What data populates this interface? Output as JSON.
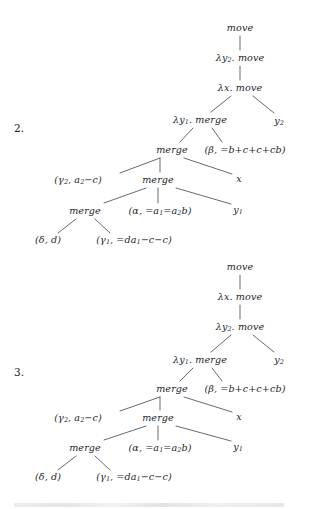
{
  "figure": {
    "background_color": "#ffffff",
    "text_color": "#22262b",
    "edge_color": "#4a4f55"
  },
  "trees": [
    {
      "number_label": "2.",
      "nodes": [
        {
          "id": "t2-move-root",
          "text": "move",
          "x": 240,
          "y": 28
        },
        {
          "id": "t2-lam-y2",
          "text": "λy₂. move",
          "x": 240,
          "y": 58
        },
        {
          "id": "t2-lam-x",
          "text": "λx. move",
          "x": 240,
          "y": 88
        },
        {
          "id": "t2-lam-y1",
          "text": "λy₁. merge",
          "x": 200,
          "y": 120
        },
        {
          "id": "t2-y2",
          "text": "y₂",
          "x": 279,
          "y": 121
        },
        {
          "id": "t2-merge-1",
          "text": "merge",
          "x": 172,
          "y": 150
        },
        {
          "id": "t2-beta",
          "text": "(β, =b+c+c+cb)",
          "x": 245,
          "y": 150
        },
        {
          "id": "t2-gamma2",
          "text": "(γ₂, a₂−c)",
          "x": 78,
          "y": 180
        },
        {
          "id": "t2-merge-2",
          "text": "merge",
          "x": 158,
          "y": 180
        },
        {
          "id": "t2-x",
          "text": "x",
          "x": 239,
          "y": 179
        },
        {
          "id": "t2-merge-3",
          "text": "merge",
          "x": 85,
          "y": 211
        },
        {
          "id": "t2-alpha",
          "text": "(α, =a₁=a₂b)",
          "x": 160,
          "y": 211
        },
        {
          "id": "t2-y1",
          "text": "y₁",
          "x": 238,
          "y": 210
        },
        {
          "id": "t2-delta",
          "text": "(δ, d)",
          "x": 48,
          "y": 240
        },
        {
          "id": "t2-gamma1",
          "text": "(γ₁, =da₁−c−c)",
          "x": 134,
          "y": 240
        }
      ],
      "edges": [
        {
          "from": "t2-move-root",
          "to": "t2-lam-y2",
          "x1": 240,
          "y1": 36,
          "x2": 240,
          "y2": 50
        },
        {
          "from": "t2-lam-y2",
          "to": "t2-lam-x",
          "x1": 240,
          "y1": 66,
          "x2": 240,
          "y2": 80
        },
        {
          "from": "t2-lam-x",
          "to": "t2-lam-y1",
          "x1": 231,
          "y1": 96,
          "x2": 211,
          "y2": 112
        },
        {
          "from": "t2-lam-x",
          "to": "t2-y2",
          "x1": 253,
          "y1": 96,
          "x2": 274,
          "y2": 113
        },
        {
          "from": "t2-lam-y1",
          "to": "t2-merge-1",
          "x1": 193,
          "y1": 128,
          "x2": 180,
          "y2": 142
        },
        {
          "from": "t2-lam-y1",
          "to": "t2-beta",
          "x1": 212,
          "y1": 128,
          "x2": 222,
          "y2": 142
        },
        {
          "from": "t2-merge-1",
          "to": "t2-gamma2",
          "x1": 160,
          "y1": 158,
          "x2": 120,
          "y2": 173
        },
        {
          "from": "t2-merge-1",
          "to": "t2-merge-2",
          "x1": 160,
          "y1": 158,
          "x2": 160,
          "y2": 172
        },
        {
          "from": "t2-merge-1",
          "to": "t2-x",
          "x1": 184,
          "y1": 158,
          "x2": 232,
          "y2": 174
        },
        {
          "from": "t2-merge-2",
          "to": "t2-merge-3",
          "x1": 146,
          "y1": 188,
          "x2": 104,
          "y2": 203
        },
        {
          "from": "t2-merge-2",
          "to": "t2-alpha",
          "x1": 158,
          "y1": 188,
          "x2": 158,
          "y2": 203
        },
        {
          "from": "t2-merge-2",
          "to": "t2-y1",
          "x1": 176,
          "y1": 188,
          "x2": 231,
          "y2": 204
        },
        {
          "from": "t2-merge-3",
          "to": "t2-delta",
          "x1": 76,
          "y1": 219,
          "x2": 58,
          "y2": 233
        },
        {
          "from": "t2-merge-3",
          "to": "t2-gamma1",
          "x1": 95,
          "y1": 219,
          "x2": 110,
          "y2": 233
        }
      ],
      "number_position": {
        "x": 14,
        "y": 122
      }
    },
    {
      "number_label": "3.",
      "nodes": [
        {
          "id": "t3-move-root",
          "text": "move",
          "x": 240,
          "y": 267
        },
        {
          "id": "t3-lam-x",
          "text": "λx. move",
          "x": 240,
          "y": 297
        },
        {
          "id": "t3-lam-y2",
          "text": "λy₂. move",
          "x": 240,
          "y": 327
        },
        {
          "id": "t3-lam-y1",
          "text": "λy₁. merge",
          "x": 200,
          "y": 360
        },
        {
          "id": "t3-y2",
          "text": "y₂",
          "x": 279,
          "y": 360
        },
        {
          "id": "t3-merge-1",
          "text": "merge",
          "x": 172,
          "y": 389
        },
        {
          "id": "t3-beta",
          "text": "(β, =b+c+c+cb)",
          "x": 245,
          "y": 389
        },
        {
          "id": "t3-gamma2",
          "text": "(γ₂, a₂−c)",
          "x": 78,
          "y": 418
        },
        {
          "id": "t3-merge-2",
          "text": "merge",
          "x": 158,
          "y": 418
        },
        {
          "id": "t3-x",
          "text": "x",
          "x": 239,
          "y": 417
        },
        {
          "id": "t3-merge-3",
          "text": "merge",
          "x": 85,
          "y": 448
        },
        {
          "id": "t3-alpha",
          "text": "(α, =a₁=a₂b)",
          "x": 160,
          "y": 448
        },
        {
          "id": "t3-y1",
          "text": "y₁",
          "x": 238,
          "y": 447
        },
        {
          "id": "t3-delta",
          "text": "(δ, d)",
          "x": 48,
          "y": 477
        },
        {
          "id": "t3-gamma1",
          "text": "(γ₁, =da₁−c−c)",
          "x": 134,
          "y": 477
        }
      ],
      "edges": [
        {
          "from": "t3-move-root",
          "to": "t3-lam-x",
          "x1": 240,
          "y1": 275,
          "x2": 240,
          "y2": 289
        },
        {
          "from": "t3-lam-x",
          "to": "t3-lam-y2",
          "x1": 240,
          "y1": 305,
          "x2": 240,
          "y2": 319
        },
        {
          "from": "t3-lam-y2",
          "to": "t3-lam-y1",
          "x1": 231,
          "y1": 335,
          "x2": 211,
          "y2": 352
        },
        {
          "from": "t3-lam-y2",
          "to": "t3-y2",
          "x1": 253,
          "y1": 335,
          "x2": 274,
          "y2": 352
        },
        {
          "from": "t3-lam-y1",
          "to": "t3-merge-1",
          "x1": 193,
          "y1": 368,
          "x2": 180,
          "y2": 381
        },
        {
          "from": "t3-lam-y1",
          "to": "t3-beta",
          "x1": 212,
          "y1": 368,
          "x2": 222,
          "y2": 381
        },
        {
          "from": "t3-merge-1",
          "to": "t3-gamma2",
          "x1": 160,
          "y1": 397,
          "x2": 120,
          "y2": 411
        },
        {
          "from": "t3-merge-1",
          "to": "t3-merge-2",
          "x1": 160,
          "y1": 397,
          "x2": 160,
          "y2": 410
        },
        {
          "from": "t3-merge-1",
          "to": "t3-x",
          "x1": 184,
          "y1": 397,
          "x2": 232,
          "y2": 412
        },
        {
          "from": "t3-merge-2",
          "to": "t3-merge-3",
          "x1": 146,
          "y1": 426,
          "x2": 104,
          "y2": 440
        },
        {
          "from": "t3-merge-2",
          "to": "t3-alpha",
          "x1": 158,
          "y1": 426,
          "x2": 158,
          "y2": 440
        },
        {
          "from": "t3-merge-2",
          "to": "t3-y1",
          "x1": 176,
          "y1": 426,
          "x2": 231,
          "y2": 441
        },
        {
          "from": "t3-merge-3",
          "to": "t3-delta",
          "x1": 76,
          "y1": 456,
          "x2": 58,
          "y2": 470
        },
        {
          "from": "t3-merge-3",
          "to": "t3-gamma1",
          "x1": 95,
          "y1": 456,
          "x2": 110,
          "y2": 470
        }
      ],
      "number_position": {
        "x": 14,
        "y": 366
      }
    }
  ]
}
